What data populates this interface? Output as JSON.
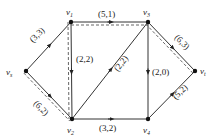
{
  "diagram": {
    "type": "network-flow",
    "nodes": [
      {
        "id": "vs",
        "label": "v",
        "sub": "s",
        "x": 26,
        "y": 71,
        "lx": 6,
        "ly": 75
      },
      {
        "id": "v1",
        "label": "v",
        "sub": "1",
        "x": 71,
        "y": 22,
        "lx": 66,
        "ly": 15
      },
      {
        "id": "v3",
        "label": "v",
        "sub": "3",
        "x": 148,
        "y": 22,
        "lx": 143,
        "ly": 15
      },
      {
        "id": "vt",
        "label": "v",
        "sub": "t",
        "x": 195,
        "y": 71,
        "lx": 200,
        "ly": 74
      },
      {
        "id": "v2",
        "label": "v",
        "sub": "2",
        "x": 72,
        "y": 119,
        "lx": 67,
        "ly": 133
      },
      {
        "id": "v4",
        "label": "v",
        "sub": "4",
        "x": 148,
        "y": 119,
        "lx": 143,
        "ly": 133
      }
    ],
    "edges": [
      {
        "from": "vs",
        "to": "v1",
        "label": "(3,3)",
        "lx": 33,
        "ly": 43,
        "rot": -45,
        "dashed": false
      },
      {
        "from": "vs",
        "to": "v2",
        "label": "(6,2)",
        "lx": 33,
        "ly": 104,
        "rot": 45,
        "dashed": true
      },
      {
        "from": "v1",
        "to": "v2",
        "label": "(2,2)",
        "lx": 76,
        "ly": 62,
        "rot": 0,
        "dashed": true
      },
      {
        "from": "v1",
        "to": "v3",
        "label": "(5,1)",
        "lx": 98,
        "ly": 17,
        "rot": 0,
        "dashed": true
      },
      {
        "from": "v2",
        "to": "v3",
        "label": "(2,2)",
        "lx": 118,
        "ly": 72,
        "rot": -52,
        "dashed": false
      },
      {
        "from": "v2",
        "to": "v4",
        "label": "(3,2)",
        "lx": 99,
        "ly": 131,
        "rot": 0,
        "dashed": false
      },
      {
        "from": "v3",
        "to": "v4",
        "label": "(2,0)",
        "lx": 152,
        "ly": 75,
        "rot": 0,
        "dashed": false
      },
      {
        "from": "v3",
        "to": "vt",
        "label": "(6,3)",
        "lx": 174,
        "ly": 38,
        "rot": 45,
        "dashed": true
      },
      {
        "from": "v4",
        "to": "vt",
        "label": "(5,2)",
        "lx": 176,
        "ly": 100,
        "rot": -45,
        "dashed": false
      }
    ]
  }
}
